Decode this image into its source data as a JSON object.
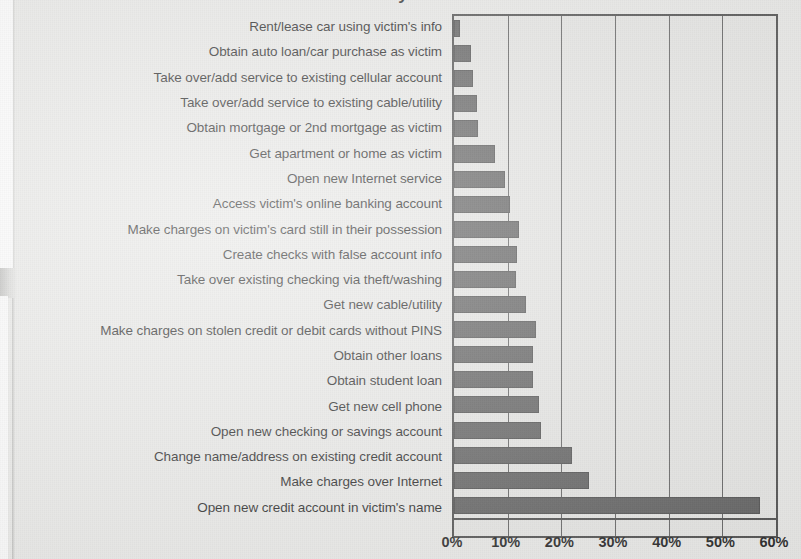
{
  "figure": {
    "title_fragment": "Identity Theft",
    "bar_color": "#5b5b5b",
    "plot_background": "#e4e4e2",
    "page_background": "#e8e8e6",
    "axis_color": "#4a4a4a"
  },
  "chart_data": {
    "type": "bar",
    "orientation": "horizontal",
    "title": "",
    "xlabel": "",
    "ylabel": "",
    "xlim": [
      0,
      60
    ],
    "xtick_labels": [
      "0%",
      "10%",
      "20%",
      "30%",
      "40%",
      "50%",
      "60%"
    ],
    "xticks": [
      0,
      10,
      20,
      30,
      40,
      50,
      60
    ],
    "grid": "vertical",
    "legend": "none",
    "value_unit": "percent",
    "categories": [
      "Rent/lease car using victim's info",
      "Obtain auto loan/car purchase as victim",
      "Take over/add service to existing cellular account",
      "Take over/add service to existing cable/utility",
      "Obtain mortgage or 2nd mortgage as victim",
      "Get apartment or home as victim",
      "Open new Internet service",
      "Access victim's online banking account",
      "Make charges on victim's card still in their possession",
      "Create checks with false account info",
      "Take over existing checking via theft/washing",
      "Get new cable/utility",
      "Make charges on stolen credit or debit cards without PINS",
      "Obtain other loans",
      "Obtain student loan",
      "Get new cell phone",
      "Open new checking or savings account",
      "Change name/address on existing credit account",
      "Make charges over Internet",
      "Open new credit account in victim's name"
    ],
    "values": [
      1.2,
      3.2,
      3.6,
      4.2,
      4.5,
      7.6,
      9.5,
      10.5,
      12.2,
      11.8,
      11.5,
      13.5,
      15.2,
      14.8,
      14.8,
      15.8,
      16.2,
      22.0,
      25.2,
      57.0
    ]
  }
}
